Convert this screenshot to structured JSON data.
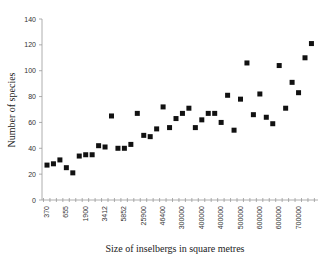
{
  "chart_data": {
    "type": "scatter",
    "title": "",
    "xlabel": "Size of inselbergs in square metres",
    "ylabel": "Number of species",
    "ylim": [
      0,
      140
    ],
    "yticks": [
      0,
      20,
      40,
      60,
      80,
      100,
      120,
      140
    ],
    "xtick_labels": [
      "370",
      "655",
      "1900",
      "3412",
      "5852",
      "25900",
      "46400",
      "300000",
      "400000",
      "400000",
      "500000",
      "600000",
      "600000",
      "700000"
    ],
    "grid": false,
    "legend": null,
    "marker": "square",
    "values": [
      27,
      28,
      31,
      25,
      21,
      34,
      35,
      35,
      42,
      41,
      65,
      40,
      40,
      43,
      67,
      50,
      49,
      55,
      72,
      56,
      63,
      67,
      71,
      56,
      62,
      67,
      67,
      60,
      81,
      54,
      78,
      106,
      66,
      82,
      64,
      59,
      104,
      71,
      91,
      83,
      110,
      121
    ]
  }
}
